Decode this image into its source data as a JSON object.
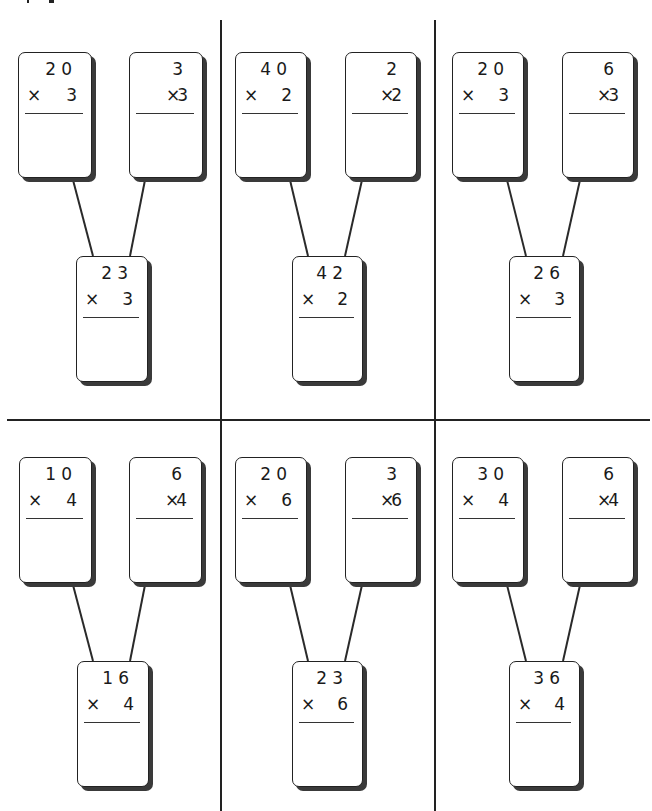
{
  "worksheet": {
    "layout": {
      "rows": 2,
      "columns": 3
    },
    "problems": [
      {
        "id": "p1",
        "left_card": {
          "top": "20",
          "multiplier": "3"
        },
        "right_card": {
          "top": "3",
          "multiplier": "3"
        },
        "combined_card": {
          "top": "23",
          "multiplier": "3"
        }
      },
      {
        "id": "p2",
        "left_card": {
          "top": "40",
          "multiplier": "2"
        },
        "right_card": {
          "top": "2",
          "multiplier": "2"
        },
        "combined_card": {
          "top": "42",
          "multiplier": "2"
        }
      },
      {
        "id": "p3",
        "left_card": {
          "top": "20",
          "multiplier": "3"
        },
        "right_card": {
          "top": "6",
          "multiplier": "3"
        },
        "combined_card": {
          "top": "26",
          "multiplier": "3"
        }
      },
      {
        "id": "p4",
        "left_card": {
          "top": "10",
          "multiplier": "4"
        },
        "right_card": {
          "top": "6",
          "multiplier": "4"
        },
        "combined_card": {
          "top": "16",
          "multiplier": "4"
        }
      },
      {
        "id": "p5",
        "left_card": {
          "top": "20",
          "multiplier": "6"
        },
        "right_card": {
          "top": "3",
          "multiplier": "6"
        },
        "combined_card": {
          "top": "23",
          "multiplier": "6"
        }
      },
      {
        "id": "p6",
        "left_card": {
          "top": "30",
          "multiplier": "4"
        },
        "right_card": {
          "top": "6",
          "multiplier": "4"
        },
        "combined_card": {
          "top": "36",
          "multiplier": "4"
        }
      }
    ],
    "symbols": {
      "times": "×"
    },
    "colors": {
      "ink": "#222222",
      "shadow": "#3a3a3a",
      "paper": "#ffffff"
    }
  }
}
